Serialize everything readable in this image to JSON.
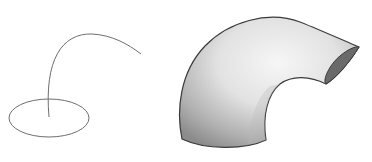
{
  "diagram": {
    "type": "sweep-illustration",
    "left": {
      "description": "profile ellipse with sweep path curve",
      "stroke_color": "#6e6e6e"
    },
    "right": {
      "description": "swept tube (half-torus elbow)",
      "outline_color": "#3a3a3a",
      "shade_light": "#f4f4f4",
      "shade_mid": "#c8c8c8",
      "shade_dark": "#8a8a8a",
      "end_cap_color": "#6a6a6a"
    }
  }
}
